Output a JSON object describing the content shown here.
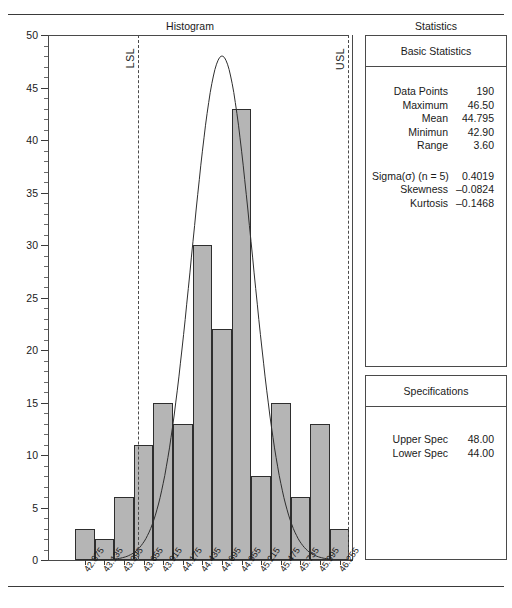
{
  "header": {
    "histogram_title": "Histogram",
    "statistics_title": "Statistics"
  },
  "panels": {
    "basic": {
      "heading": "Basic Statistics",
      "rows": [
        {
          "label": "Data Points",
          "value": "190"
        },
        {
          "label": "Maximum",
          "value": "46.50"
        },
        {
          "label": "Mean",
          "value": "44.795"
        },
        {
          "label": "Minimun",
          "value": "42.90"
        },
        {
          "label": "Range",
          "value": "3.60"
        }
      ],
      "rows2": [
        {
          "label": "Sigma(σ) (n = 5)",
          "value": "0.4019"
        },
        {
          "label": "Skewness",
          "value": "–0.0824"
        },
        {
          "label": "Kurtosis",
          "value": "–0.1468"
        }
      ]
    },
    "specifications": {
      "heading": "Specifications",
      "rows": [
        {
          "label": "Upper Spec",
          "value": "48.00"
        },
        {
          "label": "Lower Spec",
          "value": "44.00"
        }
      ]
    }
  },
  "markers": {
    "lsl_label": "LSL",
    "usl_label": "USL"
  },
  "colors": {
    "bar_fill": "#b5b5b5",
    "bar_border": "#2e2e2e",
    "axis": "#4a4a4a",
    "curve": "#2e2e2e"
  },
  "chart_data": {
    "type": "bar",
    "title": "Histogram",
    "xlabel": "",
    "ylabel": "",
    "ylim": [
      0,
      50
    ],
    "ytick_step": 5,
    "yticks": [
      0,
      5,
      10,
      15,
      20,
      25,
      30,
      35,
      40,
      45,
      50
    ],
    "grid": false,
    "legend": "none",
    "categories": [
      "42.875",
      "43.135",
      "43.395",
      "43.655",
      "43.915",
      "44.175",
      "44.435",
      "44.695",
      "44.955",
      "45.215",
      "45.475",
      "45.735",
      "45.995",
      "46.255"
    ],
    "values": [
      3,
      2,
      6,
      11,
      15,
      13,
      30,
      22,
      43,
      8,
      15,
      6,
      13,
      3
    ],
    "annotations": [
      {
        "name": "LSL",
        "label": "LSL",
        "type": "vline",
        "x_category_index": 2.7
      },
      {
        "name": "USL",
        "label": "USL",
        "type": "vline",
        "x_category_index": 13.45
      }
    ],
    "overlay": {
      "type": "normal-curve",
      "peak_value": 48,
      "peak_category_index": 7.0,
      "mean": 44.795,
      "sigma": 0.4019
    }
  }
}
